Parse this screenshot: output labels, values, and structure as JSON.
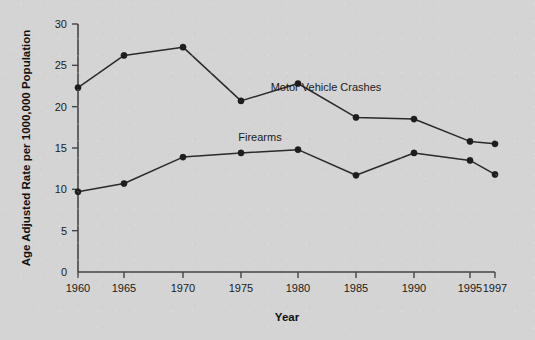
{
  "chart_data": {
    "type": "line",
    "title": "",
    "xlabel": "Year",
    "ylabel": "Age Adjusted Rate per 1000,000 Population",
    "x": [
      1960,
      1965,
      1970,
      1975,
      1980,
      1985,
      1990,
      1995,
      1997
    ],
    "xtick_labels": [
      "1960",
      "1965",
      "1970",
      "1975",
      "1980",
      "1985",
      "1990",
      "1995",
      "1997"
    ],
    "ytick_labels": [
      "0",
      "5",
      "10",
      "15",
      "20",
      "25",
      "30"
    ],
    "ytick_values": [
      0,
      5,
      10,
      15,
      20,
      25,
      30
    ],
    "xlim": [
      1960,
      1997
    ],
    "ylim": [
      0,
      30
    ],
    "grid": false,
    "legend_position": "inline-annotation",
    "series": [
      {
        "name": "Motor Vehicle Crashes",
        "values": [
          22.3,
          26.2,
          27.2,
          20.7,
          22.8,
          18.7,
          18.5,
          15.8,
          15.5
        ],
        "color": "#2a2a2a",
        "annotation": "Motor Vehicle Crashes"
      },
      {
        "name": "Firearms",
        "values": [
          9.7,
          10.7,
          13.9,
          14.4,
          14.8,
          11.7,
          14.4,
          13.5,
          11.8
        ],
        "color": "#2a2a2a",
        "annotation": "Firearms"
      }
    ],
    "annotations": [
      {
        "text": "Motor Vehicle Crashes",
        "x_px": 326,
        "y_px": 91
      },
      {
        "text": "Firearms",
        "x_px": 260,
        "y_px": 141
      }
    ]
  },
  "colors": {
    "background": "#d4d4d4",
    "axis": "#444444",
    "series": "#2a2a2a",
    "text": "#1a1a1a"
  }
}
